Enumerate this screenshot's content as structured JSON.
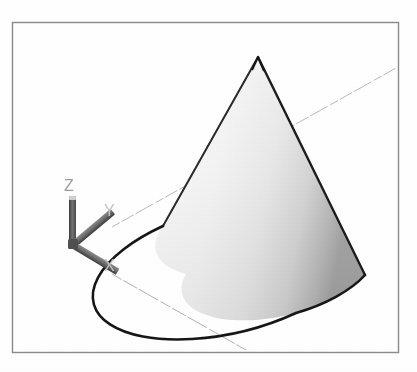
{
  "viewport": {
    "background_color": "#ffffff",
    "width": 417,
    "height": 372,
    "frame": {
      "name": "viewport-border-frame",
      "x": 12,
      "y": 22,
      "width": 386,
      "height": 330,
      "stroke_color": "#8a8a8a",
      "stroke_width": 1.4
    }
  },
  "axis_triad": {
    "origin": {
      "x": 73,
      "y": 245
    },
    "arm_color": "#6d6d6d",
    "arm_shadow_color": "#3f3f3f",
    "arm_width": 6,
    "axes": [
      {
        "id": "z",
        "label": "Z",
        "tip": {
          "x": 73,
          "y": 196
        },
        "label_pos": {
          "x": 64,
          "y": 190
        },
        "label_color": "#9a9a9a",
        "label_size": 15
      },
      {
        "id": "y",
        "label": "Y",
        "tip": {
          "x": 112,
          "y": 227
        },
        "label_pos": {
          "x": 104,
          "y": 215
        },
        "label_color": "#c2c2c2",
        "label_size": 15
      },
      {
        "id": "x",
        "label": "X",
        "tip": {
          "x": 112,
          "y": 274
        },
        "label_pos": {
          "x": 104,
          "y": 270
        },
        "label_color": "#c2c2c2",
        "label_size": 15
      }
    ]
  },
  "world_axis_lines": {
    "stroke_color": "#b9b9b9",
    "stroke_width": 1.0,
    "lines": [
      {
        "id": "y-world-line",
        "x1": 112,
        "y1": 227,
        "x2": 396,
        "y2": 68
      },
      {
        "id": "x-world-line",
        "x1": 112,
        "y1": 274,
        "x2": 246,
        "y2": 350
      }
    ]
  },
  "cone": {
    "name": "shaded-cone",
    "apex": {
      "x": 258,
      "y": 57
    },
    "base_center": {
      "x": 264,
      "y": 268
    },
    "base_rx": 102,
    "base_ry": 46,
    "base_rotation_deg": -14,
    "outline_color": "#1c1c1c",
    "outline_width": 2.2,
    "fill_light": "#f4f4f4",
    "fill_mid": "#e4e4e4",
    "fill_dark": "#b4b4b4",
    "fill_edge_dark": "#9a9a9a",
    "leftmost": {
      "x": 163,
      "y": 226
    },
    "rightmost": {
      "x": 365,
      "y": 281
    },
    "lowest": {
      "x": 294,
      "y": 313
    }
  }
}
